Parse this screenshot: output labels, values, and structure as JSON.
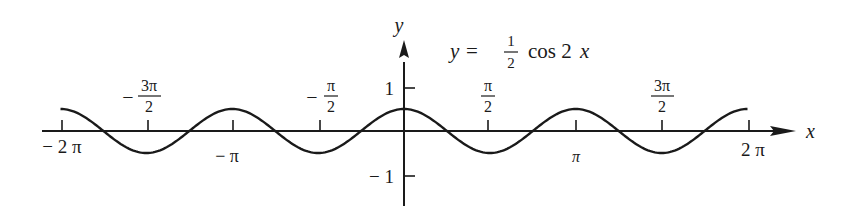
{
  "chart_data": {
    "type": "line",
    "equation": {
      "lhs": "y",
      "eq": "=",
      "frac_num": "1",
      "frac_den": "2",
      "func": "cos 2",
      "var": "x"
    },
    "xlabel": "x",
    "ylabel": "y",
    "xlim": [
      -6.2832,
      6.2832
    ],
    "ylim": [
      -1,
      1
    ],
    "grid": false,
    "legend": null,
    "x_ticks": [
      {
        "value": -6.2832,
        "label": "− 2 π",
        "position": "below"
      },
      {
        "value": -4.7124,
        "label_minus": "−",
        "label_num": "3π",
        "label_den": "2",
        "position": "above"
      },
      {
        "value": -3.1416,
        "label": "− π",
        "position": "below"
      },
      {
        "value": -1.5708,
        "label_minus": "−",
        "label_num": "π",
        "label_den": "2",
        "position": "above"
      },
      {
        "value": 1.5708,
        "label_num": "π",
        "label_den": "2",
        "position": "above"
      },
      {
        "value": 3.1416,
        "label": "π",
        "position": "below"
      },
      {
        "value": 4.7124,
        "label_num": "3π",
        "label_den": "2",
        "position": "above"
      },
      {
        "value": 6.2832,
        "label": "2 π",
        "position": "below"
      }
    ],
    "y_ticks": [
      {
        "value": 1,
        "label": "1"
      },
      {
        "value": -1,
        "label": "− 1"
      }
    ],
    "series": [
      {
        "name": "y = 1/2 cos 2x",
        "amplitude": 0.5,
        "frequency": 2,
        "x": [
          -6.2832,
          -5.4978,
          -4.7124,
          -3.927,
          -3.1416,
          -2.3562,
          -1.5708,
          -0.7854,
          0,
          0.7854,
          1.5708,
          2.3562,
          3.1416,
          3.927,
          4.7124,
          5.4978,
          6.2832
        ],
        "values": [
          0.5,
          0,
          -0.5,
          0,
          0.5,
          0,
          -0.5,
          0,
          0.5,
          0,
          -0.5,
          0,
          0.5,
          0,
          -0.5,
          0,
          0.5
        ]
      }
    ]
  }
}
